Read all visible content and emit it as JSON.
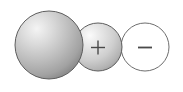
{
  "diagram": {
    "background_color": "#ffffff",
    "width": 183,
    "height": 92,
    "shapes": [
      {
        "name": "large-neutral-sphere",
        "kind": "sphere",
        "cx": 49,
        "cy": 45,
        "r": 34,
        "fill_center": "#f2f2f2",
        "fill_mid": "#bdbdbd",
        "fill_edge": "#8f8f8f",
        "stroke": "#5e5e5e",
        "stroke_width": 1,
        "highlight_x": "32%",
        "highlight_y": "26%",
        "label": ""
      },
      {
        "name": "positive-sphere",
        "kind": "sphere",
        "cx": 98,
        "cy": 47,
        "r": 24,
        "fill_center": "#fafafa",
        "fill_mid": "#d2d2d2",
        "fill_edge": "#a8a8a8",
        "stroke": "#5e5e5e",
        "stroke_width": 1,
        "highlight_x": "33%",
        "highlight_y": "26%",
        "label": "+"
      },
      {
        "name": "negative-circle",
        "kind": "circle",
        "cx": 145,
        "cy": 47,
        "r": 24,
        "fill_center": "#ffffff",
        "fill_mid": "#ffffff",
        "fill_edge": "#ffffff",
        "stroke": "#6e6e6e",
        "stroke_width": 1,
        "highlight_x": "50%",
        "highlight_y": "50%",
        "label": "−"
      }
    ],
    "labels": {
      "plus_sign": "+",
      "minus_sign": "−",
      "plus_color": "#4a4a4a",
      "minus_color": "#4a4a4a"
    }
  }
}
